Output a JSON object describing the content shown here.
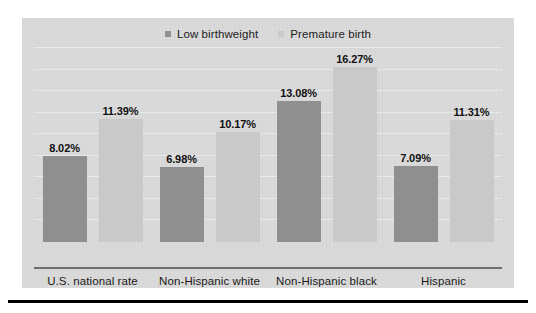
{
  "chart_data": {
    "type": "bar",
    "title": "",
    "subtitle": "",
    "xlabel": "",
    "ylabel": "",
    "ylim": [
      0,
      18
    ],
    "grid": true,
    "legend_position": "top-center",
    "categories": [
      "U.S. national rate",
      "Non-Hispanic white",
      "Non-Hispanic black",
      "Hispanic"
    ],
    "series": [
      {
        "name": "Low birthweight",
        "color": "#8f8f8f",
        "values": [
          8.02,
          6.98,
          13.08,
          7.09
        ],
        "labels": [
          "8.02%",
          "6.98%",
          "13.08%",
          "7.09%"
        ]
      },
      {
        "name": "Premature birth",
        "color": "#c9c9c9",
        "values": [
          11.39,
          10.17,
          16.27,
          11.31
        ],
        "labels": [
          "11.39%",
          "10.17%",
          "16.27%",
          "11.31%"
        ]
      }
    ]
  },
  "panel": {
    "background_color": "#d9d9d9",
    "axis_color": "#6e6e6e"
  },
  "legend": {
    "items": [
      {
        "label": "Low birthweight",
        "color": "#8f8f8f"
      },
      {
        "label": "Premature birth",
        "color": "#c9c9c9"
      }
    ]
  }
}
